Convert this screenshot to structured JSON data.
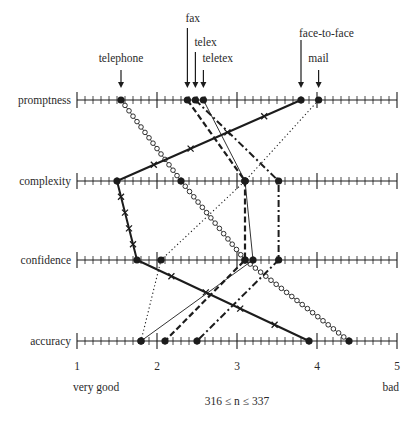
{
  "chart_data": {
    "type": "line",
    "title": "",
    "orientation": "horizontal-parallel-axes",
    "categories": [
      "promptness",
      "complexity",
      "confidence",
      "accuracy"
    ],
    "x_axis": {
      "min": 1,
      "max": 5,
      "ticks": [
        "1",
        "2",
        "3",
        "4",
        "5"
      ],
      "minor_step": 0.1,
      "left_label": "very good",
      "right_label": "bad"
    },
    "note": "316 ≤ n ≤ 337",
    "series": [
      {
        "name": "telephone",
        "style": "open-circles",
        "values": [
          1.55,
          2.3,
          3.1,
          4.4
        ]
      },
      {
        "name": "fax",
        "style": "dashed",
        "values": [
          2.38,
          3.1,
          3.1,
          2.1
        ]
      },
      {
        "name": "telex",
        "style": "dash-dot",
        "values": [
          2.48,
          3.52,
          3.52,
          2.5
        ]
      },
      {
        "name": "teletex",
        "style": "thin-solid",
        "values": [
          2.58,
          3.1,
          3.2,
          1.8
        ]
      },
      {
        "name": "face-to-face",
        "style": "thick-solid-x",
        "values": [
          3.8,
          1.5,
          1.75,
          3.9
        ]
      },
      {
        "name": "mail",
        "style": "dotted",
        "values": [
          4.02,
          3.1,
          2.05,
          1.8
        ]
      }
    ],
    "top_labels": [
      {
        "name": "telephone",
        "label_y": 62,
        "arrow_top": 70,
        "arrow_len": 18
      },
      {
        "name": "fax",
        "label_y": 22,
        "arrow_top": 28,
        "arrow_len": 60
      },
      {
        "name": "telex",
        "label_y": 46,
        "arrow_top": 52,
        "arrow_len": 36
      },
      {
        "name": "teletex",
        "label_y": 62,
        "arrow_top": 70,
        "arrow_len": 18
      },
      {
        "name": "face-to-face",
        "label_y": 37,
        "arrow_top": 40,
        "arrow_len": 48
      },
      {
        "name": "mail",
        "label_y": 62,
        "arrow_top": 70,
        "arrow_len": 18
      }
    ],
    "grid": false,
    "legend": "none (series labelled by arrows above top axis)"
  }
}
